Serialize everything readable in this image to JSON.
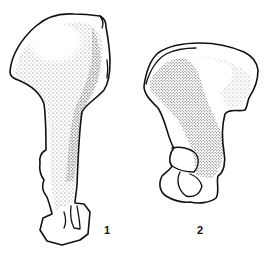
{
  "figure": {
    "ink_color": "#111111",
    "background_color": "#ffffff",
    "specimens": [
      {
        "label": "1",
        "shape": "elongated ilium with narrow shaft and blocky base"
      },
      {
        "label": "2",
        "shape": "broad ilium with acetabulum and obturator opening"
      }
    ]
  }
}
